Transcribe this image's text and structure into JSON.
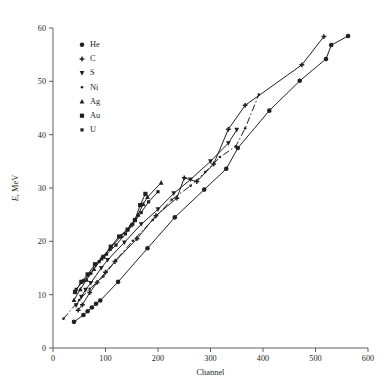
{
  "page": {
    "top_partial_text": ""
  },
  "chart_data": {
    "type": "line",
    "title": "",
    "xlabel": "Channel",
    "ylabel": "E, MeV",
    "ylabel_italic_part": "E",
    "ylabel_rest": ", MeV",
    "xlim": [
      0,
      600
    ],
    "ylim": [
      0,
      60
    ],
    "xticks": [
      0,
      100,
      200,
      300,
      400,
      500,
      600
    ],
    "yticks": [
      0,
      10,
      20,
      30,
      40,
      50,
      60
    ],
    "grid": false,
    "legend_position": "upper-left",
    "marker_colors": {
      "primary": "#231f20"
    },
    "series": [
      {
        "name": "He",
        "marker": "circle",
        "linestyle": "solid",
        "points": [
          {
            "x": 40,
            "y": 4.9
          },
          {
            "x": 58,
            "y": 6.2
          },
          {
            "x": 66,
            "y": 6.9
          },
          {
            "x": 74,
            "y": 7.6
          },
          {
            "x": 82,
            "y": 8.3
          },
          {
            "x": 90,
            "y": 8.9
          },
          {
            "x": 124,
            "y": 12.4
          },
          {
            "x": 180,
            "y": 18.7
          },
          {
            "x": 232,
            "y": 24.5
          },
          {
            "x": 288,
            "y": 29.7
          },
          {
            "x": 330,
            "y": 33.6
          },
          {
            "x": 352,
            "y": 37.5
          },
          {
            "x": 412,
            "y": 44.5
          },
          {
            "x": 470,
            "y": 50.1
          },
          {
            "x": 520,
            "y": 54.2
          },
          {
            "x": 530,
            "y": 56.8
          },
          {
            "x": 562,
            "y": 58.5
          }
        ]
      },
      {
        "name": "C",
        "marker": "plus",
        "linestyle": "solid",
        "points": [
          {
            "x": 48,
            "y": 7.1
          },
          {
            "x": 56,
            "y": 8.1
          },
          {
            "x": 70,
            "y": 10.4
          },
          {
            "x": 84,
            "y": 12.3
          },
          {
            "x": 100,
            "y": 14.2
          },
          {
            "x": 118,
            "y": 16.2
          },
          {
            "x": 160,
            "y": 20.5
          },
          {
            "x": 196,
            "y": 24.8
          },
          {
            "x": 236,
            "y": 28.1
          },
          {
            "x": 250,
            "y": 31.9
          },
          {
            "x": 274,
            "y": 31.2
          },
          {
            "x": 306,
            "y": 34.5
          },
          {
            "x": 334,
            "y": 41.0
          },
          {
            "x": 366,
            "y": 45.5
          },
          {
            "x": 474,
            "y": 53.1
          },
          {
            "x": 516,
            "y": 58.4
          }
        ]
      },
      {
        "name": "S",
        "marker": "triangle-down",
        "linestyle": "solid",
        "points": [
          {
            "x": 44,
            "y": 8.0
          },
          {
            "x": 54,
            "y": 9.6
          },
          {
            "x": 62,
            "y": 10.9
          },
          {
            "x": 72,
            "y": 12.2
          },
          {
            "x": 92,
            "y": 15.0
          },
          {
            "x": 104,
            "y": 16.5
          },
          {
            "x": 136,
            "y": 19.8
          },
          {
            "x": 168,
            "y": 23.2
          },
          {
            "x": 200,
            "y": 26.0
          },
          {
            "x": 230,
            "y": 29.0
          },
          {
            "x": 262,
            "y": 31.6
          },
          {
            "x": 300,
            "y": 35.0
          },
          {
            "x": 334,
            "y": 38.4
          },
          {
            "x": 350,
            "y": 40.9
          }
        ]
      },
      {
        "name": "Ni",
        "marker": "dot",
        "linestyle": "dashdot",
        "points": [
          {
            "x": 20,
            "y": 5.5
          },
          {
            "x": 50,
            "y": 9.0
          },
          {
            "x": 70,
            "y": 11.1
          },
          {
            "x": 96,
            "y": 13.4
          },
          {
            "x": 120,
            "y": 16.5
          },
          {
            "x": 152,
            "y": 20.1
          },
          {
            "x": 190,
            "y": 24.0
          },
          {
            "x": 226,
            "y": 27.8
          },
          {
            "x": 262,
            "y": 30.4
          },
          {
            "x": 290,
            "y": 33.0
          },
          {
            "x": 318,
            "y": 35.8
          },
          {
            "x": 348,
            "y": 37.8
          },
          {
            "x": 366,
            "y": 41.2
          },
          {
            "x": 392,
            "y": 47.5
          }
        ]
      },
      {
        "name": "Ag",
        "marker": "triangle-up",
        "linestyle": "solid",
        "points": [
          {
            "x": 40,
            "y": 9.0
          },
          {
            "x": 52,
            "y": 11.0
          },
          {
            "x": 64,
            "y": 12.8
          },
          {
            "x": 78,
            "y": 14.8
          },
          {
            "x": 92,
            "y": 16.8
          },
          {
            "x": 108,
            "y": 18.6
          },
          {
            "x": 130,
            "y": 21.0
          },
          {
            "x": 148,
            "y": 23.0
          },
          {
            "x": 162,
            "y": 25.0
          },
          {
            "x": 172,
            "y": 27.0
          },
          {
            "x": 180,
            "y": 28.3
          },
          {
            "x": 206,
            "y": 31.0
          }
        ]
      },
      {
        "name": "Au",
        "marker": "square",
        "linestyle": "solid",
        "points": [
          {
            "x": 42,
            "y": 10.5
          },
          {
            "x": 54,
            "y": 12.4
          },
          {
            "x": 66,
            "y": 13.8
          },
          {
            "x": 80,
            "y": 15.7
          },
          {
            "x": 96,
            "y": 17.1
          },
          {
            "x": 110,
            "y": 19.0
          },
          {
            "x": 126,
            "y": 20.9
          },
          {
            "x": 142,
            "y": 22.2
          },
          {
            "x": 156,
            "y": 24.0
          },
          {
            "x": 166,
            "y": 26.8
          },
          {
            "x": 176,
            "y": 28.9
          }
        ]
      },
      {
        "name": "U",
        "marker": "small-square",
        "linestyle": "solid",
        "points": [
          {
            "x": 44,
            "y": 11.0
          },
          {
            "x": 58,
            "y": 12.6
          },
          {
            "x": 72,
            "y": 14.0
          },
          {
            "x": 88,
            "y": 16.2
          },
          {
            "x": 102,
            "y": 17.6
          },
          {
            "x": 120,
            "y": 19.3
          },
          {
            "x": 138,
            "y": 21.4
          },
          {
            "x": 152,
            "y": 23.2
          },
          {
            "x": 168,
            "y": 25.4
          },
          {
            "x": 182,
            "y": 27.4
          },
          {
            "x": 200,
            "y": 29.3
          }
        ]
      }
    ],
    "legend": [
      {
        "label": "He",
        "marker": "circle"
      },
      {
        "label": "C",
        "marker": "plus"
      },
      {
        "label": "S",
        "marker": "triangle-down"
      },
      {
        "label": "Ni",
        "marker": "dot"
      },
      {
        "label": "Ag",
        "marker": "triangle-up"
      },
      {
        "label": "Au",
        "marker": "square"
      },
      {
        "label": "U",
        "marker": "small-square"
      }
    ]
  }
}
